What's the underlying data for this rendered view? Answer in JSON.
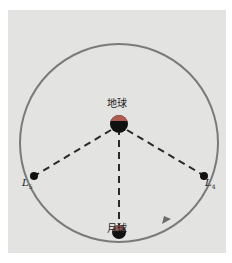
{
  "diagram": {
    "type": "lagrange-points-earth-moon",
    "labels": {
      "earth": "地球",
      "moon": "月球",
      "l5_main": "L",
      "l5_sub": "5",
      "l4_main": "L",
      "l4_sub": "4"
    },
    "colors": {
      "background": "#e3e3e1",
      "orbit": "#7a7a7a",
      "dashes": "#2a2a2a",
      "earth_top": "#b05a52",
      "earth_bottom": "#111111",
      "point": "#111111",
      "arrow": "#6e6e6e"
    },
    "elements": [
      {
        "name": "orbit",
        "kind": "circle"
      },
      {
        "name": "earth",
        "kind": "two-tone-disc",
        "label": "地球"
      },
      {
        "name": "moon",
        "kind": "two-tone-disc",
        "label": "月球"
      },
      {
        "name": "L4",
        "kind": "point"
      },
      {
        "name": "L5",
        "kind": "point"
      },
      {
        "name": "earth-moon-line",
        "kind": "dashed-line"
      },
      {
        "name": "earth-L4-line",
        "kind": "dashed-line"
      },
      {
        "name": "earth-L5-line",
        "kind": "dashed-line"
      },
      {
        "name": "orbit-direction-arrow",
        "kind": "arrow",
        "direction": "counterclockwise"
      }
    ]
  }
}
